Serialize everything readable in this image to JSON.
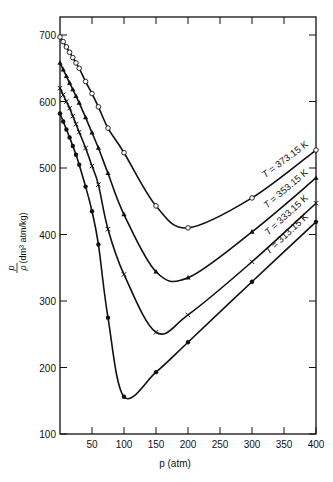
{
  "chart_data": {
    "type": "line",
    "title": "",
    "xlabel": "p (atm)",
    "ylabel": "p/ρ (dm³ atm/kg)",
    "xlim": [
      0,
      400
    ],
    "ylim": [
      100,
      750
    ],
    "x_ticks": [
      50,
      100,
      150,
      200,
      250,
      300,
      350,
      400
    ],
    "y_ticks": [
      100,
      200,
      300,
      400,
      500,
      600,
      700
    ],
    "grid": false,
    "legend": "inline labels at right end of each curve",
    "series": [
      {
        "name": "T = 373.15 K",
        "marker": "open-circle",
        "x": [
          0,
          5,
          10,
          15,
          20,
          25,
          30,
          40,
          50,
          60,
          75,
          100,
          150,
          200,
          300,
          400
        ],
        "y": [
          697,
          690,
          682,
          674,
          666,
          658,
          650,
          630,
          612,
          592,
          560,
          523,
          443,
          410,
          455,
          527
        ]
      },
      {
        "name": "T = 353.15 K",
        "marker": "filled-triangle",
        "x": [
          0,
          5,
          10,
          15,
          20,
          25,
          30,
          40,
          50,
          60,
          75,
          100,
          150,
          200,
          300,
          400
        ],
        "y": [
          658,
          648,
          638,
          628,
          618,
          608,
          598,
          576,
          553,
          530,
          492,
          430,
          344,
          335,
          404,
          485
        ]
      },
      {
        "name": "T = 333.15 K",
        "marker": "cross",
        "x": [
          0,
          5,
          10,
          15,
          20,
          25,
          30,
          40,
          50,
          60,
          75,
          100,
          150,
          200,
          300,
          400
        ],
        "y": [
          620,
          610,
          600,
          590,
          578,
          566,
          554,
          530,
          503,
          475,
          408,
          340,
          253,
          279,
          359,
          447
        ]
      },
      {
        "name": "T = 313.15 K",
        "marker": "filled-circle",
        "x": [
          0,
          5,
          10,
          15,
          20,
          25,
          30,
          40,
          50,
          60,
          75,
          100,
          150,
          200,
          300,
          400
        ],
        "y": [
          582,
          570,
          558,
          546,
          533,
          520,
          505,
          472,
          435,
          385,
          275,
          156,
          193,
          238,
          329,
          419
        ]
      }
    ]
  },
  "labels": {
    "x_axis": "p (atm)",
    "y_axis_num": "p",
    "y_axis_den": "ρ",
    "y_axis_unit": "(dm³ atm/kg)"
  }
}
